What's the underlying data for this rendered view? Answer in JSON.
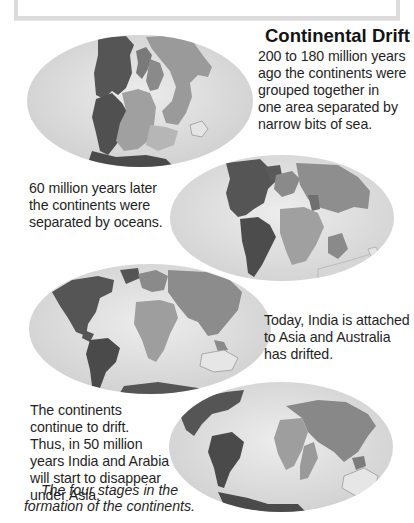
{
  "title": "Continental Drift",
  "stages": [
    {
      "id": "stage-1",
      "lines": [
        "200 to 180 million years",
        "ago the continents were",
        "grouped together in",
        "one area separated by",
        "narrow bits of sea."
      ]
    },
    {
      "id": "stage-2",
      "lines": [
        "60 million years later",
        "the continents were",
        "separated by oceans."
      ]
    },
    {
      "id": "stage-3",
      "lines": [
        "Today, India is attached",
        "to Asia and Australia",
        "has drifted."
      ]
    },
    {
      "id": "stage-4",
      "lines": [
        "The continents",
        "continue to drift.",
        "Thus, in 50 million",
        "years India and Arabia",
        "will start to disappear",
        "under Asia."
      ]
    }
  ],
  "caption": {
    "lines": [
      "The four stages in the",
      "formation of the continents."
    ]
  },
  "colors": {
    "ocean": "#dedede",
    "ocean_edge": "#cfcfcf",
    "americas": "#555555",
    "africa_europe": "#9a9a9a",
    "asia": "#8a8a8a",
    "australia": "#e4e4e4",
    "text": "#1f1f1f"
  },
  "globes": [
    {
      "name": "pangaea-globe",
      "label": "Pangaea"
    },
    {
      "name": "cretaceous-globe",
      "label": "60 million years later"
    },
    {
      "name": "present-day-globe",
      "label": "Today"
    },
    {
      "name": "future-globe",
      "label": "In 50 million years"
    }
  ]
}
